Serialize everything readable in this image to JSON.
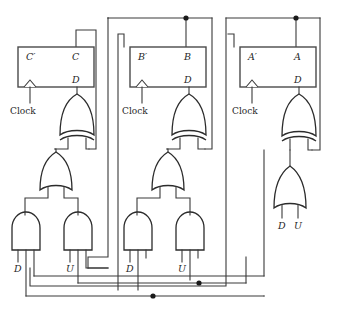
{
  "diagram": {
    "background_color": "#ffffff",
    "wire_color": "#3a3a3a",
    "gate_fill": "#ffffff",
    "junction_color": "#1a1a1a"
  },
  "stages": [
    {
      "id": "stage-c",
      "flipflop": {
        "name": "flipflop-c",
        "q_bar_label": "C′",
        "q_label": "C",
        "d_label": "D",
        "clock_label": "Clock"
      },
      "gates": [
        {
          "name": "xor-gate-c",
          "type": "xor",
          "inputs": 2
        },
        {
          "name": "or-gate-c",
          "type": "or",
          "inputs": 2
        },
        {
          "name": "and-gate-c-down",
          "type": "and",
          "inputs": 3
        },
        {
          "name": "and-gate-c-up",
          "type": "and",
          "inputs": 3
        }
      ],
      "input_labels": [
        {
          "name": "input-label-d-c",
          "text": "D"
        },
        {
          "name": "input-label-u-c",
          "text": "U"
        }
      ]
    },
    {
      "id": "stage-b",
      "flipflop": {
        "name": "flipflop-b",
        "q_bar_label": "B′",
        "q_label": "B",
        "d_label": "D",
        "clock_label": "Clock"
      },
      "gates": [
        {
          "name": "xor-gate-b",
          "type": "xor",
          "inputs": 2
        },
        {
          "name": "or-gate-b",
          "type": "or",
          "inputs": 2
        },
        {
          "name": "and-gate-b-down",
          "type": "and",
          "inputs": 3
        },
        {
          "name": "and-gate-b-up",
          "type": "and",
          "inputs": 3
        }
      ],
      "input_labels": [
        {
          "name": "input-label-d-b",
          "text": "D"
        },
        {
          "name": "input-label-u-b",
          "text": "U"
        }
      ]
    },
    {
      "id": "stage-a",
      "flipflop": {
        "name": "flipflop-a",
        "q_bar_label": "A′",
        "q_label": "A",
        "d_label": "D",
        "clock_label": "Clock"
      },
      "gates": [
        {
          "name": "xor-gate-a",
          "type": "xor",
          "inputs": 2
        },
        {
          "name": "or-gate-a",
          "type": "or",
          "inputs": 2
        }
      ],
      "input_labels": [
        {
          "name": "input-label-d-a",
          "text": "D"
        },
        {
          "name": "input-label-u-a",
          "text": "U"
        }
      ]
    }
  ],
  "labels": {
    "c_prime": "C′",
    "c": "C",
    "b_prime": "B′",
    "b": "B",
    "a_prime": "A′",
    "a": "A",
    "d_pin_c": "D",
    "d_pin_b": "D",
    "d_pin_a": "D",
    "clock_c": "Clock",
    "clock_b": "Clock",
    "clock_a": "Clock",
    "down_c": "D",
    "up_c": "U",
    "down_b": "D",
    "up_b": "U",
    "down_a": "D",
    "up_a": "U"
  }
}
